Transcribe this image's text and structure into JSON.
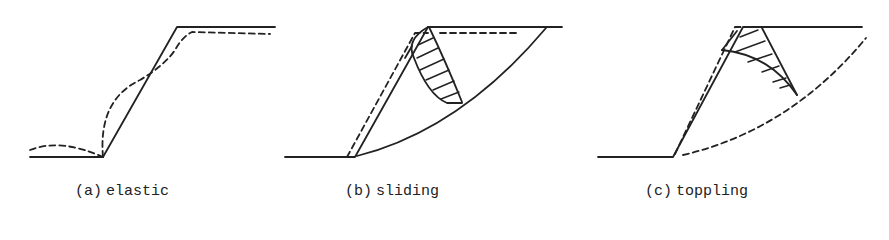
{
  "figure": {
    "panels": [
      {
        "id": "a",
        "prefix": "(a)",
        "label": "elastic"
      },
      {
        "id": "b",
        "prefix": "(b)",
        "label": "sliding"
      },
      {
        "id": "c",
        "prefix": "(c)",
        "label": "toppling"
      }
    ],
    "legend_hint": {
      "solid_line": "original slope profile",
      "dashed_line": "deformed slope / failure surface"
    },
    "colors": {
      "line": "#222222",
      "background": "#ffffff"
    }
  }
}
